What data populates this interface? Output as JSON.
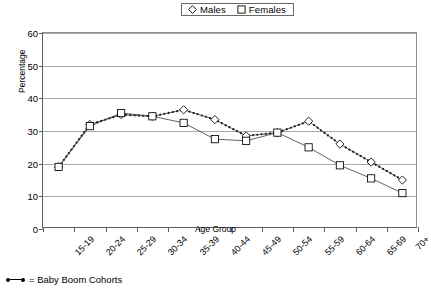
{
  "legend": {
    "entries": [
      {
        "label": "Males",
        "marker": "diamond-outline"
      },
      {
        "label": "Females",
        "marker": "square-outline"
      }
    ]
  },
  "axes": {
    "y_title": "Percentage",
    "x_title": "Age Group",
    "y_ticks": [
      "0",
      "10",
      "20",
      "30",
      "40",
      "50",
      "60"
    ]
  },
  "footnote": {
    "text": "= Baby Boom Cohorts",
    "marker_name": "baby-boom-dotted-marker"
  },
  "chart_data": {
    "type": "line",
    "title": "",
    "xlabel": "Age Group",
    "ylabel": "Percentage",
    "ylim": [
      0,
      60
    ],
    "ytick_step": 10,
    "grid": true,
    "legend_position": "top-center",
    "categories": [
      "15-19",
      "20-24",
      "25-29",
      "30-34",
      "35-39",
      "40-44",
      "45-49",
      "50-54",
      "55-59",
      "60-64",
      "65-69",
      "70+"
    ],
    "series": [
      {
        "name": "Males",
        "marker": "diamond-outline",
        "values": [
          19.0,
          32.0,
          35.0,
          34.5,
          36.5,
          33.5,
          28.5,
          29.5,
          33.0,
          26.0,
          20.5,
          15.0
        ]
      },
      {
        "name": "Females",
        "marker": "square-outline",
        "values": [
          19.0,
          31.5,
          35.5,
          34.5,
          32.5,
          27.5,
          27.0,
          29.5,
          25.0,
          19.5,
          15.5,
          11.0
        ]
      }
    ],
    "annotation_overlay": {
      "name": "baby-boom-cohorts",
      "style": "dotted",
      "description": "Dotted trend line overlay marking the Baby Boom cohort path across all age groups",
      "values": [
        19.0,
        32.0,
        35.0,
        34.5,
        36.5,
        33.5,
        28.5,
        29.5,
        33.0,
        26.0,
        20.5,
        15.0
      ]
    }
  }
}
